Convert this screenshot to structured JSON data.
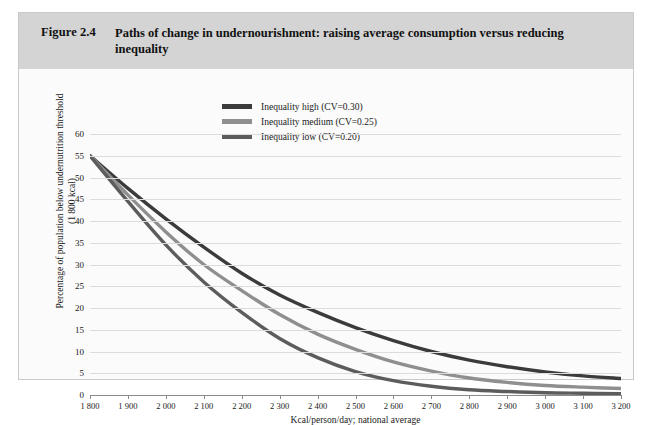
{
  "figure": {
    "number": "Figure 2.4",
    "title": "Paths of change in undernourishment: raising average consumption versus reducing inequality"
  },
  "chart_data": {
    "type": "line",
    "title": "Paths of change in undernourishment: raising average consumption versus reducing inequality",
    "xlabel": "Kcal/person/day; national average",
    "ylabel": "Percentage of population below undernutrition threshold (1 800 kcal)",
    "ylabel_line1": "Percentage of population below undernutrition threshold",
    "ylabel_line2": "(1 800 kcal)",
    "xlim": [
      1800,
      3200
    ],
    "ylim": [
      0,
      60
    ],
    "grid": true,
    "legend_position": "top-center",
    "x_tick_labels": [
      "1 800",
      "1 900",
      "2 000",
      "2 100",
      "2 200",
      "2 300",
      "2 400",
      "2 500",
      "2 600",
      "2 700",
      "2 800",
      "2 900",
      "3 000",
      "3 100",
      "3 200"
    ],
    "y_tick_labels": [
      "0",
      "5",
      "10",
      "15",
      "20",
      "25",
      "30",
      "35",
      "40",
      "45",
      "50",
      "55",
      "60"
    ],
    "x": [
      1800,
      1900,
      2000,
      2100,
      2200,
      2300,
      2400,
      2500,
      2600,
      2700,
      2800,
      2900,
      3000,
      3100,
      3200
    ],
    "series": [
      {
        "name": "Inequality high (CV=0.30)",
        "color": "#3b3b3b",
        "values": [
          55.0,
          47.5,
          40.5,
          34.0,
          28.0,
          23.0,
          19.0,
          15.5,
          12.5,
          10.0,
          8.0,
          6.5,
          5.3,
          4.4,
          3.8
        ]
      },
      {
        "name": "Inequality medium (CV=0.25)",
        "color": "#8f8f8f",
        "values": [
          55.0,
          46.0,
          37.5,
          30.0,
          24.0,
          18.5,
          14.0,
          10.5,
          7.6,
          5.5,
          3.9,
          2.9,
          2.2,
          1.8,
          1.5
        ]
      },
      {
        "name": "Inequality low (CV=0.20)",
        "color": "#5c5c5c",
        "values": [
          55.0,
          44.5,
          34.5,
          26.0,
          19.0,
          13.0,
          8.6,
          5.4,
          3.3,
          2.0,
          1.2,
          0.8,
          0.5,
          0.4,
          0.3
        ]
      }
    ]
  }
}
